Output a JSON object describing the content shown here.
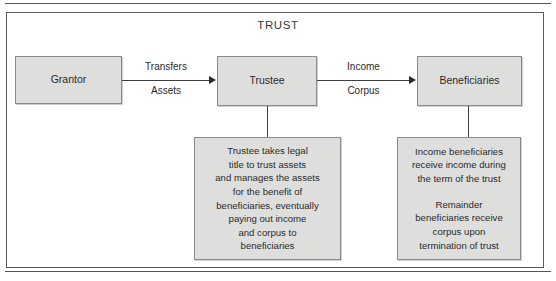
{
  "figure": {
    "frame_title": "TRUST",
    "background_color": "#ffffff",
    "box_fill_color": "#dededd",
    "box_border_color": "#8a8a8a",
    "line_color": "#3f3f3f",
    "text_color": "#2b2b2b"
  },
  "nodes": {
    "grantor": {
      "label": "Grantor"
    },
    "trustee": {
      "label": "Trustee"
    },
    "beneficiaries": {
      "label": "Beneficiaries"
    }
  },
  "edges": {
    "grantor_to_trustee": {
      "label_top": "Transfers",
      "label_bottom": "Assets"
    },
    "trustee_to_beneficiaries": {
      "label_top": "Income",
      "label_bottom": "Corpus"
    }
  },
  "details": {
    "trustee": {
      "paragraphs": [
        "Trustee takes legal\ntitle to trust assets\nand manages the assets\nfor the benefit of\nbeneficiaries, eventually\npaying out income\nand corpus to\nbeneficiaries"
      ]
    },
    "beneficiaries": {
      "paragraphs": [
        "Income beneficiaries\nreceive income during\nthe term of the trust",
        "Remainder\nbeneficiaries receive\ncorpus upon\ntermination of trust"
      ]
    }
  }
}
